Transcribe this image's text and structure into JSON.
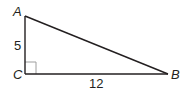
{
  "diagram": {
    "type": "right-triangle",
    "vertices": {
      "A": {
        "label": "A",
        "x": 25,
        "y": 16
      },
      "C": {
        "label": "C",
        "x": 25,
        "y": 74
      },
      "B": {
        "label": "B",
        "x": 168,
        "y": 74
      }
    },
    "sides": {
      "AC": {
        "label": "5"
      },
      "CB": {
        "label": "12"
      }
    },
    "right_angle_at": "C",
    "colors": {
      "stroke": "#231f20",
      "right_angle_marker": "#9e9e9e",
      "background": "#ffffff"
    }
  }
}
